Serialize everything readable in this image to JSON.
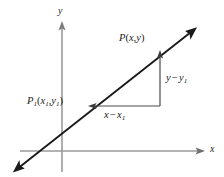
{
  "figure": {
    "type": "coordinate-geometry-diagram",
    "background_color": "#ffffff",
    "axis_color": "#9a9a9a",
    "line_color": "#1a1a1a",
    "label_color": "#1a1a1a",
    "width": 224,
    "height": 177
  },
  "axes": {
    "x_axis": {
      "label": "x",
      "start": [
        20,
        151
      ],
      "end": [
        205,
        151
      ],
      "arrow": "right"
    },
    "y_axis": {
      "label": "y",
      "start": [
        62,
        172
      ],
      "end": [
        62,
        22
      ],
      "arrow": "up"
    },
    "origin": [
      62,
      151
    ]
  },
  "line": {
    "name": "secant-line",
    "start": [
      13,
      172
    ],
    "end": [
      197,
      27
    ],
    "arrow": "both"
  },
  "points": [
    {
      "name": "point-p",
      "label_p": "P",
      "label_open": "(",
      "label_x": "x",
      "label_comma": ",",
      "label_y": "y",
      "label_close": ")",
      "position": [
        160,
        50
      ]
    },
    {
      "name": "point-p1",
      "label_p": "P",
      "label_p_sub": "1",
      "label_open": "(",
      "label_x": "x",
      "label_x_sub": "1",
      "label_comma": ",",
      "label_y": "y",
      "label_y_sub": "1",
      "label_close": ")",
      "position": [
        88,
        106
      ]
    }
  ],
  "legs": {
    "vertical": {
      "name": "rise-leg",
      "label_y": "y",
      "label_minus": "−",
      "label_y1": "y",
      "label_y1_sub": "1",
      "from": [
        160,
        106
      ],
      "to": [
        160,
        50
      ],
      "arrow": "up"
    },
    "horizontal": {
      "name": "run-leg",
      "label_x": "x",
      "label_minus": "−",
      "label_x1": "x",
      "label_x1_sub": "1",
      "from": [
        160,
        106
      ],
      "to": [
        88,
        106
      ],
      "arrow": "left"
    }
  }
}
